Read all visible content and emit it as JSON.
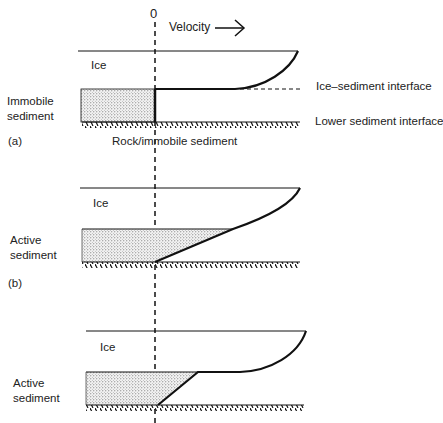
{
  "figure": {
    "axis": {
      "zero_label": "0",
      "velocity_label": "Velocity"
    },
    "panel_a": {
      "id_label": "(a)",
      "ice_label": "Ice",
      "sediment_label": "Immobile sediment",
      "interface_label": "Ice–sediment interface",
      "lower_label": "Lower sediment interface",
      "bed_label": "Rock/immobile sediment"
    },
    "panel_b": {
      "id_label": "(b)",
      "ice_label": "Ice",
      "sediment_label": "Active sediment"
    },
    "panel_c": {
      "ice_label": "Ice",
      "sediment_label": "Active sediment"
    }
  }
}
